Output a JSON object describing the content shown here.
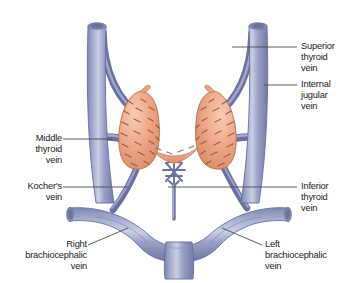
{
  "figure": {
    "background_color": "#ffffff"
  },
  "colors": {
    "vein_fill": "#9096c0",
    "vein_fill_light": "#b9bed8",
    "vein_fill_dark": "#6e74a4",
    "vein_outline": "#5d6punched",
    "vein_stroke": "#6b719f",
    "thyroid_fill": "#efa98a",
    "thyroid_fill_light": "#f6c6ae",
    "thyroid_fill_dark": "#d98763",
    "thyroid_hatch": "#8a4a33",
    "leader_line": "#555555",
    "label_text": "#1a1a1a"
  },
  "labels": [
    {
      "id": "superior-thyroid-vein",
      "text": "Superior\nthyroid\nvein",
      "align": "left",
      "x": 302,
      "y": 40,
      "leader": {
        "x1": 287,
        "y1": 47,
        "x2": 232,
        "y2": 47
      }
    },
    {
      "id": "internal-jugular-vein",
      "text": "Internal\njugular\nvein",
      "align": "left",
      "x": 302,
      "y": 80,
      "leader": {
        "x1": 287,
        "y1": 87,
        "x2": 258,
        "y2": 87
      }
    },
    {
      "id": "middle-thyroid-vein",
      "text": "Middle\nthyroid\nvein",
      "align": "right",
      "x": 17,
      "y": 132,
      "leader": {
        "x1": 69,
        "y1": 139,
        "x2": 106,
        "y2": 139
      }
    },
    {
      "id": "kochers-vein",
      "text": "Kocher's\nvein",
      "align": "right",
      "x": 11,
      "y": 180,
      "leader": {
        "x1": 69,
        "y1": 187,
        "x2": 110,
        "y2": 187
      }
    },
    {
      "id": "inferior-thyroid-vein",
      "text": "Inferior\nthyroid\nvein",
      "align": "left",
      "x": 302,
      "y": 180,
      "leader": {
        "x1": 297,
        "y1": 187,
        "x2": 172,
        "y2": 187
      }
    },
    {
      "id": "right-brachiocephalic-vein",
      "text": "Right\nbrachiocephalic\nvein",
      "align": "right",
      "x": 14,
      "y": 238,
      "leader": {
        "x1": 93,
        "y1": 245,
        "x2": 127,
        "y2": 228
      }
    },
    {
      "id": "left-brachiocephalic-vein",
      "text": "Left\nbrachiocephalic\nvein",
      "align": "left",
      "x": 263,
      "y": 238,
      "leader": {
        "x1": 258,
        "y1": 245,
        "x2": 225,
        "y2": 228
      }
    }
  ],
  "structures": [
    {
      "id": "right-internal-jugular-vein",
      "name": "Right internal jugular vein"
    },
    {
      "id": "left-internal-jugular-vein",
      "name": "Left internal jugular vein"
    },
    {
      "id": "right-superior-thyroid-vein",
      "name": "Right superior thyroid vein"
    },
    {
      "id": "left-superior-thyroid-vein",
      "name": "Left superior thyroid vein"
    },
    {
      "id": "right-middle-thyroid-vein",
      "name": "Right middle thyroid vein"
    },
    {
      "id": "left-middle-thyroid-vein",
      "name": "Left middle thyroid vein"
    },
    {
      "id": "kochers-vein-vessel",
      "name": "Kocher's vein"
    },
    {
      "id": "inferior-thyroid-vein-plexus",
      "name": "Inferior thyroid vein plexus"
    },
    {
      "id": "thyroid-right-lobe",
      "name": "Thyroid right lobe"
    },
    {
      "id": "thyroid-left-lobe",
      "name": "Thyroid left lobe"
    },
    {
      "id": "thyroid-isthmus",
      "name": "Thyroid isthmus"
    },
    {
      "id": "right-brachiocephalic-vessel",
      "name": "Right brachiocephalic vein"
    },
    {
      "id": "left-brachiocephalic-vessel",
      "name": "Left brachiocephalic vein"
    },
    {
      "id": "superior-vena-cava",
      "name": "Superior vena cava"
    }
  ]
}
